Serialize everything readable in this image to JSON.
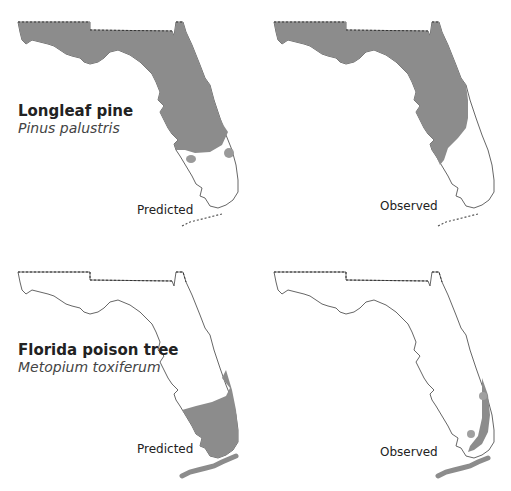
{
  "colors": {
    "range_fill": "#8c8c8c",
    "outline": "#555555",
    "background": "#ffffff"
  },
  "species": [
    {
      "common_name": "Longleaf pine",
      "scientific_name": "Pinus palustris",
      "panels": [
        {
          "caption": "Predicted",
          "description": "Range covers panhandle and peninsula down to central-south Florida, plus two small isolated patches in the south"
        },
        {
          "caption": "Observed",
          "description": "Range covers panhandle and most of peninsula except southeast coast and southern tip"
        }
      ]
    },
    {
      "common_name": "Florida poison tree",
      "scientific_name": "Metopium toxiferum",
      "panels": [
        {
          "caption": "Predicted",
          "description": "Range covers southern tip of Florida, southeast coast and Florida Keys"
        },
        {
          "caption": "Observed",
          "description": "Narrow strip along southeast coast, two small patches, and Florida Keys"
        }
      ]
    }
  ]
}
